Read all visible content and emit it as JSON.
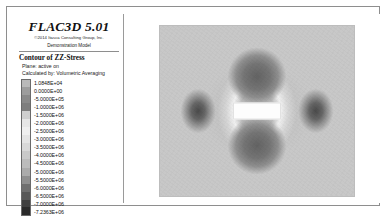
{
  "window": {
    "name": "flac3d-plot-window"
  },
  "legend": {
    "title": "FLAC3D 5.01",
    "copyright": "©2014 Itasca Consulting Group, Inc.",
    "demo_model": "Demonstration Model",
    "contour_title": "Contour of ZZ-Stress",
    "plane_line": "Plane: active on",
    "calculated_line": "Calculated by: Volumetric Averaging",
    "scale": [
      {
        "value": "1.0848E+04",
        "color": "#b9b9b9"
      },
      {
        "value": "0.0000E+00",
        "color": "#9d9d9d"
      },
      {
        "value": "-5.0000E+05",
        "color": "#8a8a8a"
      },
      {
        "value": "-1.0000E+06",
        "color": "#7e7e7e"
      },
      {
        "value": "-1.5000E+06",
        "color": "#cfcfcf"
      },
      {
        "value": "-2.0000E+06",
        "color": "#e6e6e6"
      },
      {
        "value": "-2.5000E+06",
        "color": "#efefef"
      },
      {
        "value": "-3.0000E+06",
        "color": "#e4e4e4"
      },
      {
        "value": "-3.5000E+06",
        "color": "#d8d8d8"
      },
      {
        "value": "-4.0000E+06",
        "color": "#c9c9c9"
      },
      {
        "value": "-4.5000E+06",
        "color": "#bcbcbc"
      },
      {
        "value": "-5.0000E+06",
        "color": "#ababab"
      },
      {
        "value": "-5.5000E+06",
        "color": "#8f8f8f"
      },
      {
        "value": "-6.0000E+06",
        "color": "#6f6f6f"
      },
      {
        "value": "-6.5000E+06",
        "color": "#585858"
      },
      {
        "value": "-7.0000E+06",
        "color": "#3f3f3f"
      },
      {
        "value": "-7.2363E+06",
        "color": "#2a2a2a"
      }
    ]
  },
  "chart_data": {
    "type": "heatmap",
    "title": "Contour of ZZ-Stress",
    "xlabel": "",
    "ylabel": "",
    "quantity": "ZZ-Stress",
    "units": "Pa",
    "plane": "active on",
    "averaging": "Volumetric Averaging",
    "zlim": [
      -7236300,
      10848
    ],
    "contour_levels": [
      10848,
      0,
      -500000,
      -1000000,
      -1500000,
      -2000000,
      -2500000,
      -3000000,
      -3500000,
      -4000000,
      -4500000,
      -5000000,
      -5500000,
      -6000000,
      -6500000,
      -7000000,
      -7236300
    ],
    "colormap": "grayscale",
    "grid": false,
    "legend_position": "left",
    "features": [
      {
        "name": "excavation-opening",
        "shape": "rectangle",
        "center_x": 0.5,
        "center_y": 0.5,
        "width": 0.235,
        "height": 0.087,
        "value": null
      },
      {
        "name": "crown-compression-lobe",
        "shape": "ellipse",
        "center_x": 0.5,
        "center_y": 0.3,
        "value": -6500000
      },
      {
        "name": "invert-compression-lobe",
        "shape": "ellipse",
        "center_x": 0.5,
        "center_y": 0.7,
        "value": -6500000
      },
      {
        "name": "left-sidewall-lobe",
        "shape": "ellipse",
        "center_x": 0.2,
        "center_y": 0.5,
        "value": -6000000
      },
      {
        "name": "right-sidewall-lobe",
        "shape": "ellipse",
        "center_x": 0.8,
        "center_y": 0.5,
        "value": -6000000
      },
      {
        "name": "far-field-background",
        "shape": "region",
        "value": -4000000
      }
    ]
  }
}
